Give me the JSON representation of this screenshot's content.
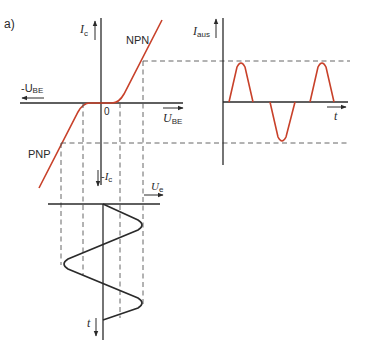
{
  "figure": {
    "panel_label": "a)",
    "colors": {
      "curve": "#c8412a",
      "axes": "#2a2a2a",
      "dashed": "#555555",
      "background": "#ffffff"
    }
  },
  "transfer_characteristic": {
    "y_axis_label": "I",
    "y_axis_sub": "c",
    "x_pos_label": "U",
    "x_pos_sub": "BE",
    "x_neg_label": "-U",
    "x_neg_sub": "BE",
    "origin_label": "0",
    "npn_label": "NPN",
    "pnp_label": "PNP"
  },
  "output_current": {
    "y_axis_label": "I",
    "y_axis_sub": "aus",
    "x_axis_label": "t"
  },
  "input_voltage": {
    "top_label": "-I",
    "top_sub": "c",
    "x_axis_label": "U",
    "x_axis_sub": "e",
    "t_axis_label": "t"
  }
}
